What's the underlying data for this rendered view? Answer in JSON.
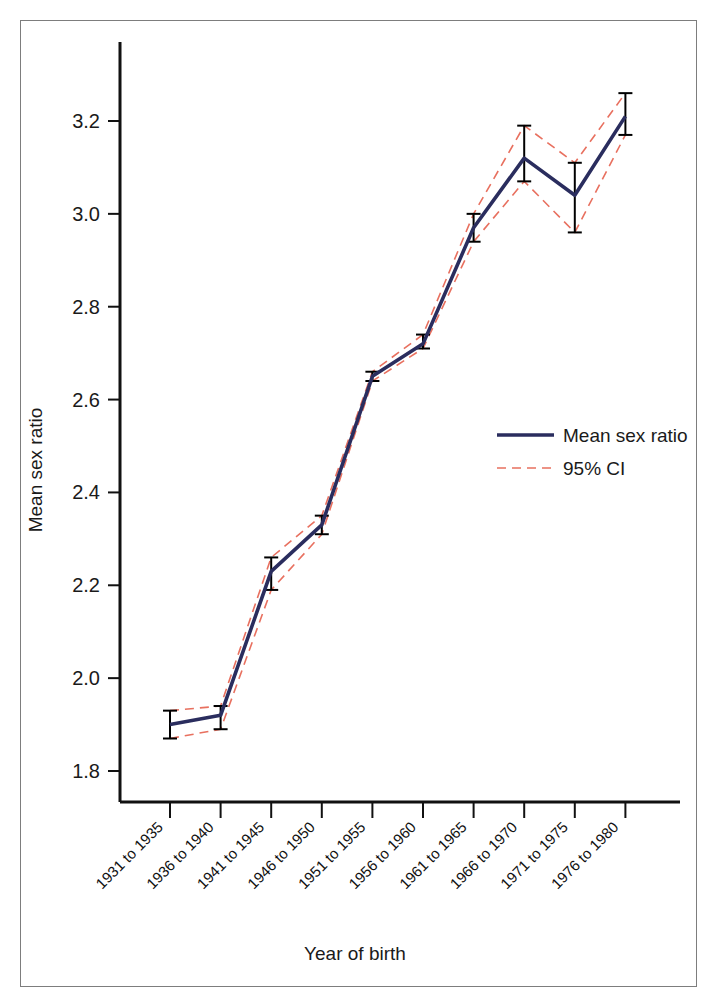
{
  "figure": {
    "border_color": "#7d7d7d",
    "background": "#ffffff"
  },
  "chart_data": {
    "type": "line",
    "title": "",
    "subtitle": "",
    "xlabel": "Year of birth",
    "ylabel": "Mean sex ratio",
    "categories": [
      "1931 to 1935",
      "1936 to 1940",
      "1941 to 1945",
      "1946 to 1950",
      "1951 to 1955",
      "1956 to 1960",
      "1961 to 1965",
      "1966 to 1970",
      "1971 to 1975",
      "1976 to 1980"
    ],
    "values": [
      1.9,
      1.92,
      2.23,
      2.33,
      2.65,
      2.72,
      2.97,
      3.12,
      3.04,
      3.21
    ],
    "ci_lower": [
      1.87,
      1.89,
      2.19,
      2.31,
      2.64,
      2.71,
      2.94,
      3.07,
      2.96,
      3.17
    ],
    "ci_upper": [
      1.93,
      1.94,
      2.26,
      2.35,
      2.66,
      2.74,
      3.0,
      3.19,
      3.11,
      3.26
    ],
    "ylim": [
      1.74,
      3.34
    ],
    "yticks": [
      1.8,
      2.0,
      2.2,
      2.4,
      2.6,
      2.8,
      3.0,
      3.2
    ],
    "ytick_labels": [
      "1.8",
      "2.0",
      "2.2",
      "2.4",
      "2.6",
      "2.8",
      "3.0",
      "3.2"
    ],
    "grid": false,
    "legend_position": "center-right",
    "series": [
      {
        "name": "Mean sex ratio",
        "style": "solid",
        "color": "#2a2d5e"
      },
      {
        "name": "95% CI",
        "style": "dashed",
        "color": "#e8705f"
      }
    ],
    "errorbar_color": "#000000",
    "category_label_rotation": -45
  },
  "legend": {
    "items": [
      {
        "label": "Mean sex ratio",
        "swatch": "solid-line-swatch"
      },
      {
        "label": "95% CI",
        "swatch": "dashed-line-swatch"
      }
    ]
  },
  "axes": {
    "x_axis_title": "Year of birth",
    "y_axis_title": "Mean sex ratio"
  }
}
